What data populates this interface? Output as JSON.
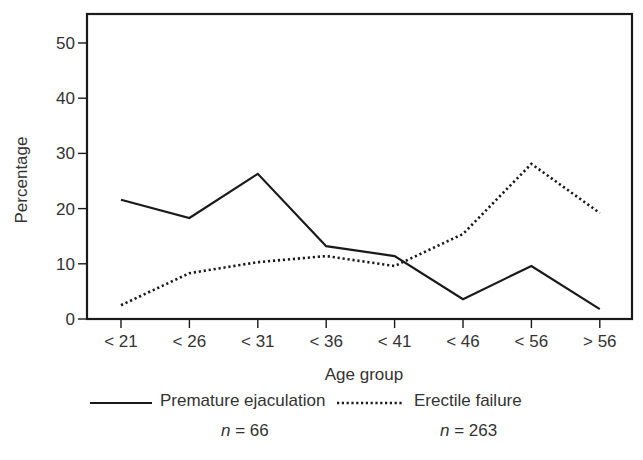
{
  "chart_data": {
    "type": "line",
    "title": "",
    "xlabel": "Age group",
    "ylabel": "Percentage",
    "ylim": [
      0,
      50
    ],
    "yticks": [
      0,
      10,
      20,
      30,
      40,
      50
    ],
    "grid": false,
    "legend_position": "bottom",
    "categories": [
      "< 21",
      "< 26",
      "< 31",
      "< 36",
      "< 41",
      "< 46",
      "< 56",
      "> 56"
    ],
    "series": [
      {
        "name": "Premature ejaculation",
        "style": "solid",
        "n": "66",
        "values": [
          21.6,
          18.3,
          26.3,
          13.2,
          11.4,
          3.6,
          9.6,
          1.8
        ]
      },
      {
        "name": "Erectile failure",
        "style": "dotted",
        "n": "263",
        "values": [
          2.5,
          8.3,
          10.3,
          11.4,
          9.6,
          15.4,
          28.1,
          19.2
        ]
      }
    ]
  },
  "legend": {
    "items": [
      {
        "label": "Premature ejaculation",
        "n_prefix": "n",
        "n_text": " = 66"
      },
      {
        "label": "Erectile failure",
        "n_prefix": "n",
        "n_text": " = 263"
      }
    ]
  },
  "colors": {
    "line": "#1a1a1a",
    "axis": "#1a1a1a",
    "text": "#333333"
  }
}
